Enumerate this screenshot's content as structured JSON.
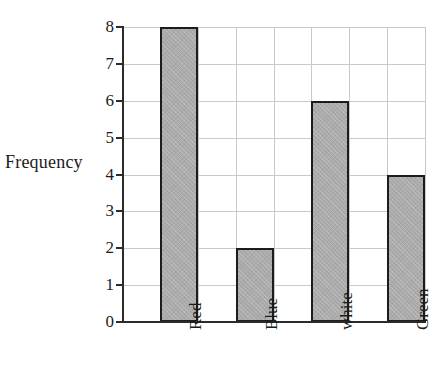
{
  "chart_data": {
    "type": "bar",
    "title": "",
    "subtitle": "",
    "xlabel": "",
    "ylabel": "Frequency",
    "categories": [
      "Red",
      "Blue",
      "white",
      "Green"
    ],
    "values": [
      8,
      2,
      6,
      4
    ],
    "ylim": [
      0,
      8
    ],
    "ytick_labels": [
      "0",
      "1",
      "2",
      "3",
      "4",
      "5",
      "6",
      "7",
      "8"
    ],
    "ytick_values": [
      0,
      1,
      2,
      3,
      4,
      5,
      6,
      7,
      8
    ],
    "grid": "both",
    "legend": "none",
    "bar_fill_color": "#ababab",
    "bar_border_color": "#1c1c1c",
    "gridline_color": "#c9c9c9",
    "axis_color": "#2b2b2b",
    "text_color": "#1b1b1b",
    "background_color": "#ffffff",
    "xtick_label_rotation": -90,
    "annotations": []
  },
  "axes": {
    "y_title": "Frequency",
    "tick_8": "8",
    "tick_7": "7",
    "tick_6": "6",
    "tick_5": "5",
    "tick_4": "4",
    "tick_3": "3",
    "tick_2": "2",
    "tick_1": "1",
    "tick_0": "0"
  },
  "bars": [
    {
      "label": "Red",
      "value": 8
    },
    {
      "label": "Blue",
      "value": 2
    },
    {
      "label": "white",
      "value": 6
    },
    {
      "label": "Green",
      "value": 4
    }
  ]
}
